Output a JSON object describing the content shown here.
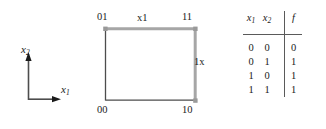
{
  "axes": {
    "x_axis_label": "x",
    "x_axis_sub": "1",
    "y_axis_label": "x",
    "y_axis_sub": "2"
  },
  "cube": {
    "corners": {
      "top_left": "01",
      "top_right": "11",
      "bottom_left": "00",
      "bottom_right": "10"
    },
    "edges": {
      "top_label": "x1",
      "right_label": "1x"
    },
    "colors": {
      "highlight_edge": "#a6a6a6",
      "plain_edge": "#4d4d4d",
      "vertex_dot": "#999999"
    }
  },
  "truth_table": {
    "headers": {
      "x1": "x",
      "x1_sub": "1",
      "x2": "x",
      "x2_sub": "2",
      "f": "f"
    },
    "rows": [
      {
        "x1": "0",
        "x2": "0",
        "f": "0"
      },
      {
        "x1": "0",
        "x2": "1",
        "f": "1"
      },
      {
        "x1": "1",
        "x2": "0",
        "f": "1"
      },
      {
        "x1": "1",
        "x2": "1",
        "f": "1"
      }
    ]
  }
}
